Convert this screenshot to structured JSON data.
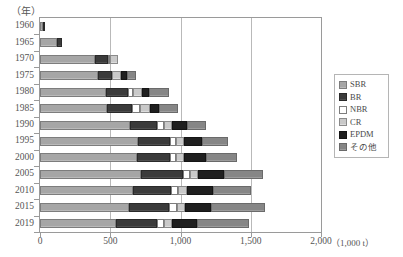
{
  "axes": {
    "y_unit_caption": "（年）",
    "x_unit_caption": "（1,000 t）",
    "x_ticks": [
      "0",
      "500",
      "1,000",
      "1,500",
      "2,000"
    ],
    "x_tick_values": [
      0,
      500,
      1000,
      1500,
      2000
    ],
    "y_ticks": [
      "1960",
      "1965",
      "1970",
      "1975",
      "1980",
      "1985",
      "1990",
      "1995",
      "2000",
      "2005",
      "2010",
      "2015",
      "2019"
    ]
  },
  "legend": {
    "position": "right",
    "items": [
      {
        "label": "SBR",
        "key": "SBR",
        "color": "#a6a6a6"
      },
      {
        "label": "BR",
        "key": "BR",
        "color": "#3b3b3b"
      },
      {
        "label": "NBR",
        "key": "NBR",
        "color": "#ffffff"
      },
      {
        "label": "CR",
        "key": "CR",
        "color": "#c9c9c9"
      },
      {
        "label": "EPDM",
        "key": "EPDM",
        "color": "#1f1f1f"
      },
      {
        "label": "その他",
        "key": "OTHER",
        "color": "#868686"
      }
    ]
  },
  "chart_data": {
    "type": "bar",
    "orientation": "horizontal",
    "stacked": true,
    "title": "",
    "xlabel": "（1,000 t）",
    "ylabel": "（年）",
    "xlim": [
      0,
      2000
    ],
    "grid": true,
    "categories": [
      "1960",
      "1965",
      "1970",
      "1975",
      "1980",
      "1985",
      "1990",
      "1995",
      "2000",
      "2005",
      "2010",
      "2015",
      "2019"
    ],
    "series": [
      {
        "name": "SBR",
        "values": [
          22,
          120,
          390,
          410,
          470,
          480,
          640,
          700,
          690,
          720,
          660,
          630,
          540
        ]
      },
      {
        "name": "BR",
        "values": [
          8,
          35,
          95,
          100,
          155,
          175,
          195,
          225,
          235,
          300,
          275,
          290,
          290
        ]
      },
      {
        "name": "NBR",
        "values": [
          0,
          0,
          15,
          0,
          35,
          55,
          45,
          45,
          45,
          50,
          50,
          55,
          55
        ]
      },
      {
        "name": "CR",
        "values": [
          0,
          0,
          55,
          70,
          65,
          70,
          60,
          55,
          55,
          55,
          60,
          55,
          55
        ]
      },
      {
        "name": "EPDM",
        "values": [
          0,
          0,
          0,
          40,
          50,
          70,
          105,
          130,
          155,
          185,
          185,
          190,
          175
        ]
      },
      {
        "name": "その他",
        "values": [
          0,
          0,
          0,
          65,
          145,
          130,
          140,
          185,
          220,
          280,
          275,
          380,
          375
        ]
      }
    ],
    "totals": [
      30,
      155,
      555,
      685,
      920,
      980,
      1185,
      1340,
      1400,
      1590,
      1505,
      1600,
      1490
    ]
  }
}
